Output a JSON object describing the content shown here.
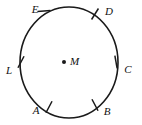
{
  "figure": {
    "type": "geometry-diagram",
    "shape": "circle",
    "stroke_color": "#1a1a1a",
    "background_color": "#ffffff",
    "center": {
      "label": "M",
      "name": "center-point",
      "x": 69,
      "y": 62,
      "dot_x": 64,
      "dot_y": 62,
      "label_x": 70,
      "label_y": 62
    },
    "circle": {
      "cx": 69,
      "cy": 62.5,
      "r": 55.5,
      "rx": 49,
      "ry": 55.5
    },
    "points": [
      {
        "label": "E",
        "name": "point-e",
        "angle_deg": 115,
        "tick_x": 44,
        "tick_y": 11,
        "tick_angle_deg": 5,
        "label_x": 35,
        "label_y": 10
      },
      {
        "label": "D",
        "name": "point-d",
        "angle_deg": 57,
        "tick_x": 95,
        "tick_y": 14,
        "tick_angle_deg": 58,
        "label_x": 109,
        "label_y": 12
      },
      {
        "label": "C",
        "name": "point-c",
        "angle_deg": 5,
        "tick_x": 116,
        "tick_y": 62,
        "tick_angle_deg": 100,
        "label_x": 128,
        "label_y": 70
      },
      {
        "label": "B",
        "name": "point-b",
        "angle_deg": -58,
        "tick_x": 95,
        "tick_y": 105,
        "tick_angle_deg": 118,
        "label_x": 107,
        "label_y": 112
      },
      {
        "label": "A",
        "name": "point-a",
        "angle_deg": -120,
        "tick_x": 49,
        "tick_y": 107,
        "tick_angle_deg": 62,
        "label_x": 36,
        "label_y": 111
      },
      {
        "label": "L",
        "name": "point-l",
        "angle_deg": 176,
        "tick_x": 21,
        "tick_y": 62,
        "tick_angle_deg": 62,
        "label_x": 9,
        "label_y": 71
      }
    ]
  }
}
